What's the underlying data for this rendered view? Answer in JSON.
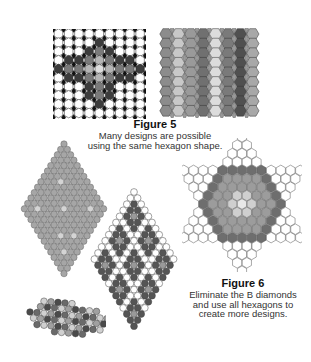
{
  "figure5": {
    "title": "Figure 5",
    "caption_lines": [
      "Many designs are possible",
      "using the same hexagon shape."
    ],
    "left_grid": {
      "cols": 9,
      "rows": 10,
      "diamond_color": "#111111",
      "pattern": [
        "WWWWWWWWW",
        "WWWWDWWWW",
        "WWWDMDWWW",
        "WDDMLMDDW",
        "DMMLPLMMD",
        "WDDMLMDDW",
        "WWWDMDWWW",
        "WWWDMDWWW",
        "WWWWDWWWW",
        "WWWWWWWWW"
      ]
    },
    "right_grid": {
      "cols": 8,
      "rows": 9,
      "diamond_color": "#9a9a9a",
      "column_colors": [
        "#8c8c8c",
        "#c8c8c8",
        "#9a9a9a",
        "#707070",
        "#dcdcdc",
        "#7a7a7a",
        "#505050",
        "#a8a8a8"
      ]
    }
  },
  "figure6": {
    "title": "Figure 6",
    "caption_lines": [
      "Eliminate the B diamonds",
      "and use all hexagons to",
      "create more designs."
    ],
    "large_diamond": {
      "size": 13,
      "fill": "#a6a6a6",
      "highlight": "#d4d4d4"
    },
    "patterned_diamond": {
      "size": 12,
      "dark": "#555555",
      "light": "#ffffff",
      "mid": "#999999"
    },
    "star": {
      "outer": "#ffffff",
      "dark": "#6e6e6e",
      "mid": "#9c9c9c",
      "light": "#cfcfcf",
      "center": "#e8e8e8"
    },
    "small_band": {
      "colors": [
        "#4a4a4a",
        "#a0a0a0",
        "#d0d0d0",
        "#6a6a6a"
      ]
    }
  },
  "palette": {
    "white": "#ffffff",
    "dark": "#3c3c3c",
    "medium": "#7a7a7a",
    "light": "#b4b4b4",
    "pale": "#dddddd",
    "stroke": "#444444"
  }
}
